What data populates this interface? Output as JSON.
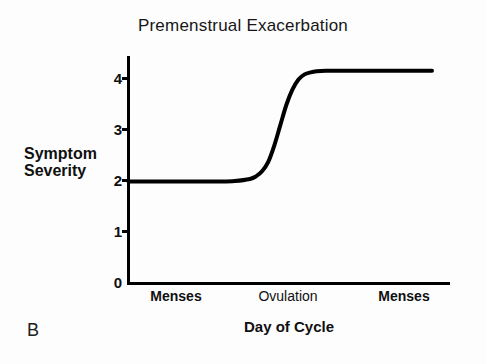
{
  "panel": {
    "label": "B"
  },
  "chart_data": {
    "type": "line",
    "title": "Premenstrual Exacerbation",
    "xlabel": "Day of Cycle",
    "ylabel": "Symptom Severity",
    "ylabel_line1": "Symptom",
    "ylabel_line2": "Severity",
    "ylim": [
      0,
      4.6
    ],
    "yticks": [
      0,
      1,
      2,
      3,
      4
    ],
    "ytick_labels": [
      "0",
      "1",
      "2",
      "3",
      "4"
    ],
    "xlim": [
      0,
      100
    ],
    "xtick_labels": [
      "Menses",
      "Ovulation",
      "Menses"
    ],
    "xtick_positions": [
      15,
      50,
      88
    ],
    "xtick_styles": [
      "bold",
      "regular",
      "bold"
    ],
    "grid": false,
    "legend": null,
    "line_color": "#000000",
    "line_width": 4,
    "series": [
      {
        "name": "Symptom Severity",
        "x": [
          0,
          5,
          10,
          15,
          20,
          25,
          30,
          35,
          40,
          42,
          44,
          46,
          48,
          50,
          52,
          54,
          56,
          58,
          60,
          62,
          65,
          70,
          75,
          80,
          85,
          90,
          95,
          100
        ],
        "values": [
          2.0,
          2.0,
          2.0,
          2.0,
          2.0,
          2.0,
          2.0,
          2.01,
          2.05,
          2.1,
          2.2,
          2.38,
          2.7,
          3.1,
          3.5,
          3.8,
          4.0,
          4.1,
          4.14,
          4.16,
          4.17,
          4.17,
          4.17,
          4.17,
          4.17,
          4.17,
          4.17,
          4.17
        ]
      }
    ],
    "baseline_value": 2.0,
    "plateau_value": 4.17,
    "transition_center_x": 50
  }
}
